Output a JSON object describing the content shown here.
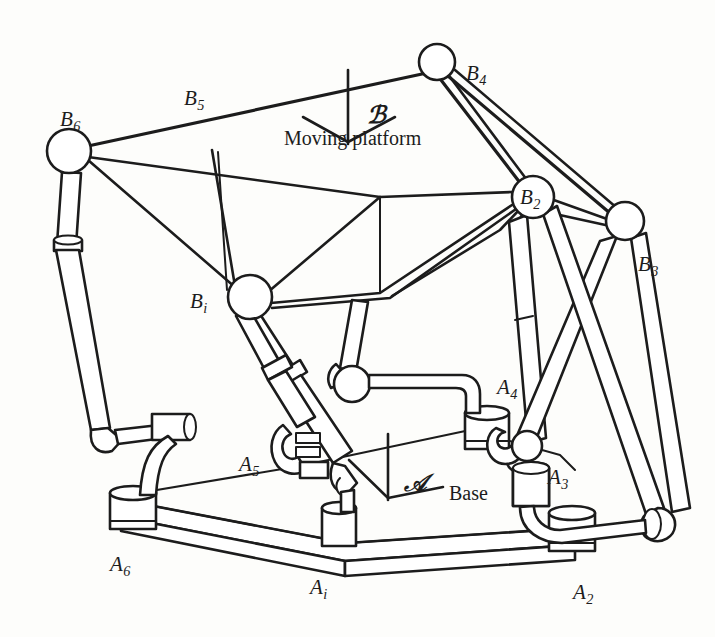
{
  "figure": {
    "kind": "engineering-line-drawing",
    "stroke_color": "#1c1c1c",
    "fill_color": "#ffffff",
    "background_color": "#fdfdfb"
  },
  "labels": {
    "moving_platform": "Moving platform",
    "base": "Base",
    "frame_b": "ℬ",
    "frame_a": "𝒜",
    "nodes": [
      {
        "id": "B6",
        "base": "B",
        "sub": "6",
        "x": 60,
        "y": 107
      },
      {
        "id": "B5",
        "base": "B",
        "sub": "5",
        "x": 184,
        "y": 86
      },
      {
        "id": "B4",
        "base": "B",
        "sub": "4",
        "x": 466,
        "y": 61
      },
      {
        "id": "B2",
        "base": "B",
        "sub": "2",
        "x": 520,
        "y": 185
      },
      {
        "id": "B3",
        "base": "B",
        "sub": "3",
        "x": 638,
        "y": 252
      },
      {
        "id": "Bi",
        "base": "B",
        "sub": "i",
        "x": 190,
        "y": 289
      },
      {
        "id": "A4",
        "base": "A",
        "sub": "4",
        "x": 497,
        "y": 375
      },
      {
        "id": "A3",
        "base": "A",
        "sub": "3",
        "x": 548,
        "y": 465
      },
      {
        "id": "A5",
        "base": "A",
        "sub": "5",
        "x": 239,
        "y": 452
      },
      {
        "id": "A6",
        "base": "A",
        "sub": "6",
        "x": 110,
        "y": 552
      },
      {
        "id": "Ai",
        "base": "A",
        "sub": "i",
        "x": 310,
        "y": 575
      },
      {
        "id": "A2",
        "base": "A",
        "sub": "2",
        "x": 573,
        "y": 580
      }
    ],
    "text_annotations": [
      {
        "id": "moving-platform",
        "text": "Moving platform",
        "x": 284,
        "y": 127
      },
      {
        "id": "base",
        "text": "Base",
        "x": 449,
        "y": 482
      },
      {
        "id": "frame-b-symbol",
        "text": "ℬ",
        "x": 367,
        "y": 100
      },
      {
        "id": "frame-a-symbol",
        "text": "𝒜",
        "x": 404,
        "y": 468
      }
    ]
  },
  "joints": {
    "platform_ball_joints": [
      {
        "id": "B6",
        "cx": 69,
        "cy": 151,
        "r": 22
      },
      {
        "id": "B4",
        "cx": 437,
        "cy": 62,
        "r": 18
      },
      {
        "id": "B2",
        "cx": 533,
        "cy": 197,
        "r": 21
      },
      {
        "id": "B3",
        "cx": 625,
        "cy": 221,
        "r": 19
      },
      {
        "id": "Bi",
        "cx": 250,
        "cy": 297,
        "r": 22
      },
      {
        "id": "B1",
        "cx": 352,
        "cy": 382,
        "r": 17
      }
    ]
  }
}
